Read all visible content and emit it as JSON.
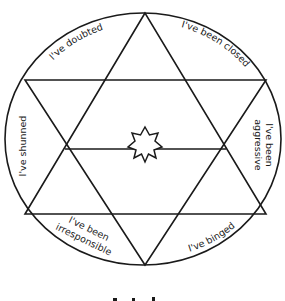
{
  "diagram": {
    "type": "hexagram-wheel",
    "center_symbol": "seven-point-star",
    "line_color": "#1a1a1a",
    "background": "#ffffff",
    "segments": [
      {
        "position": "top-left",
        "label": "I've doubted"
      },
      {
        "position": "top-right",
        "label": "I've been closed"
      },
      {
        "position": "right",
        "label_line1": "I've been",
        "label_line2": "aggressive"
      },
      {
        "position": "bottom-right",
        "label": "I've binged"
      },
      {
        "position": "bottom-left",
        "label_line1": "I've been",
        "label_line2": "irresponsible"
      },
      {
        "position": "left",
        "label": "I've shunned"
      }
    ],
    "caption": ""
  }
}
